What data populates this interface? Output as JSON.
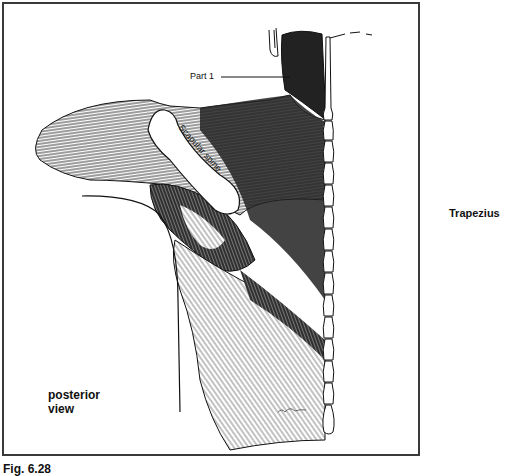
{
  "figure": {
    "caption": "Fig. 6.28",
    "title_label": "Trapezius",
    "view_label_line1": "posterior",
    "view_label_line2": "view",
    "annotations": {
      "part1": "Part 1",
      "scapular_spine": "Scapular spine"
    },
    "colors": {
      "frame": "#3a3a3a",
      "ink": "#111111",
      "background": "#ffffff"
    }
  }
}
